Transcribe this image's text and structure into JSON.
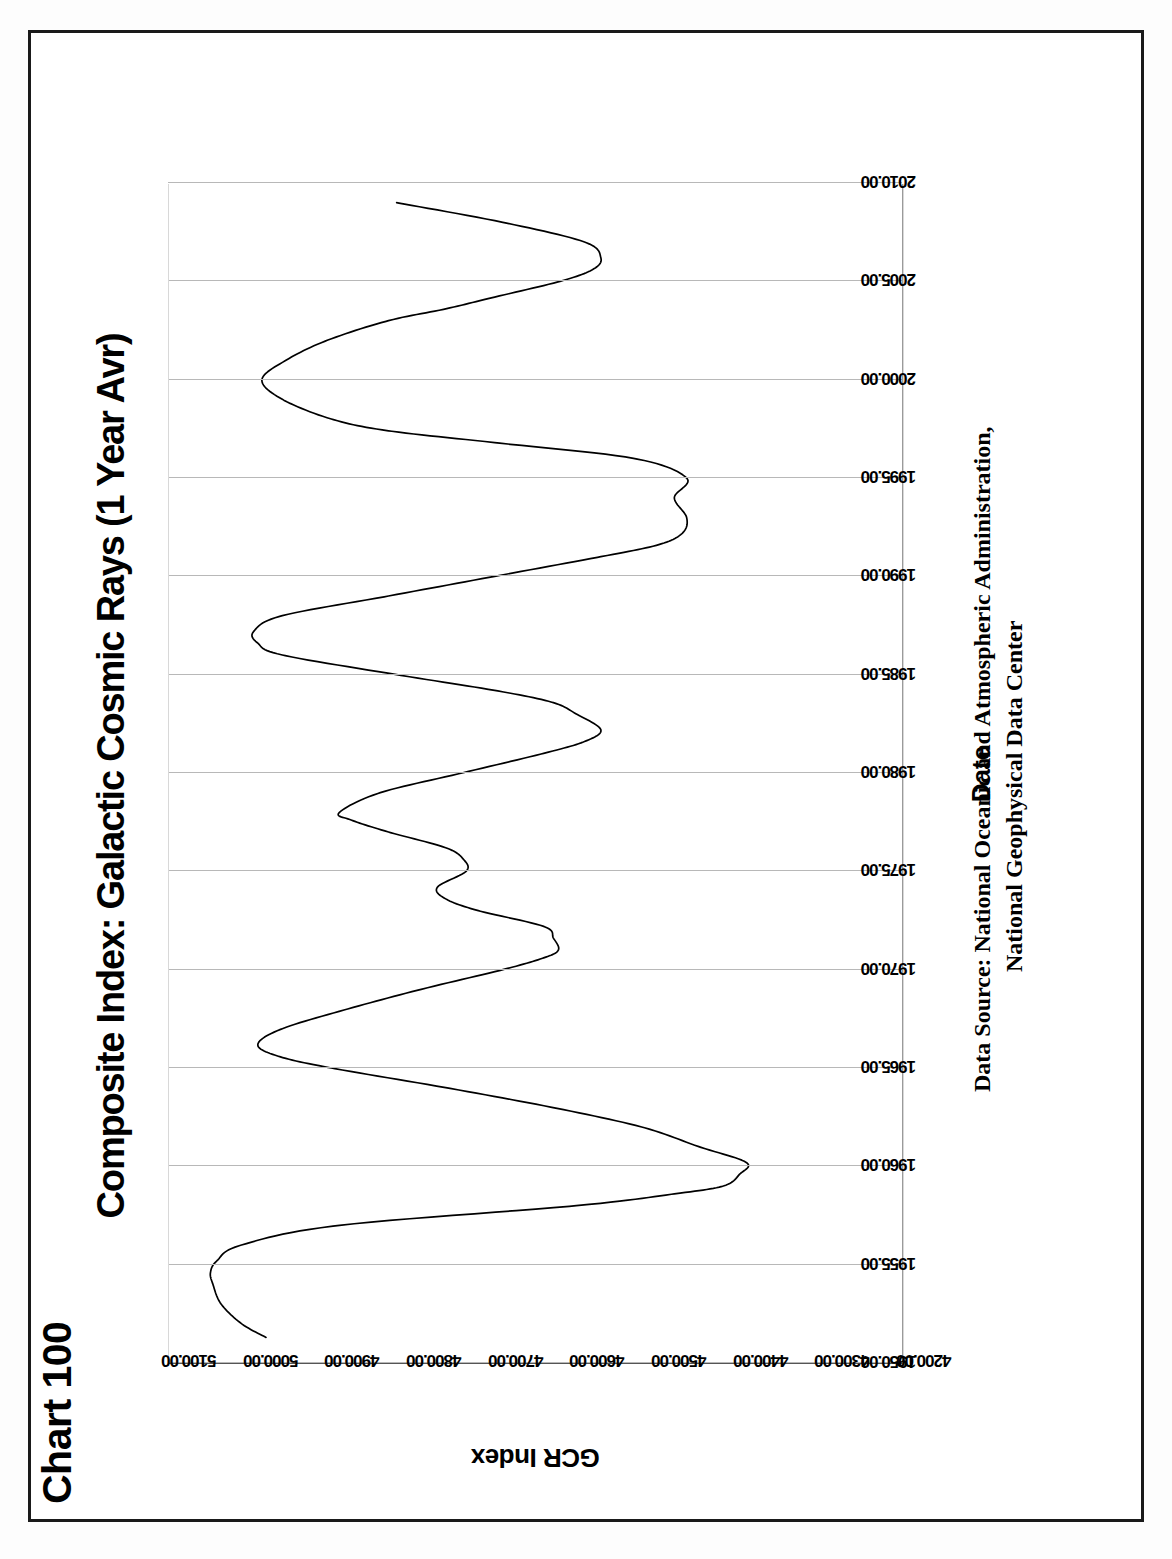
{
  "page": {
    "header": "Chart 100"
  },
  "chart_data": {
    "type": "line",
    "title": "Composite Index: Galactic Cosmic Rays (1 Year Avr)",
    "xlabel": "Date",
    "ylabel": "GCR Index",
    "source_line1": "Data Source:  National Oceanic and Atmospheric Administration,",
    "source_line2": "National Geophysical Data Center",
    "grid": true,
    "legend": "none",
    "xlim": [
      1950.0,
      2010.0
    ],
    "ylim": [
      4200.0,
      5100.0
    ],
    "xticks": [
      "1950.00",
      "1955.00",
      "1960.00",
      "1965.00",
      "1970.00",
      "1975.00",
      "1980.00",
      "1985.00",
      "1990.00",
      "1995.00",
      "2000.00",
      "2005.00",
      "2010.00"
    ],
    "yticks": [
      "4200.00",
      "4300.00",
      "4400.00",
      "4500.00",
      "4600.00",
      "4700.00",
      "4800.00",
      "4900.00",
      "5000.00",
      "5100.00"
    ],
    "series": [
      {
        "name": "GCR Index (1 Year Avr)",
        "color": "#000000",
        "x": [
          1951.3,
          1952.0,
          1953.0,
          1954.0,
          1954.6,
          1955.2,
          1956.0,
          1957.0,
          1958.0,
          1958.6,
          1959.0,
          1959.6,
          1960.2,
          1961.0,
          1962.0,
          1963.0,
          1964.0,
          1965.0,
          1965.6,
          1966.2,
          1967.0,
          1968.0,
          1969.0,
          1970.0,
          1970.6,
          1971.0,
          1971.6,
          1972.2,
          1973.0,
          1973.6,
          1974.2,
          1975.0,
          1975.6,
          1976.2,
          1977.0,
          1977.6,
          1978.0,
          1979.0,
          1980.0,
          1981.0,
          1981.6,
          1982.2,
          1983.0,
          1983.6,
          1984.2,
          1985.0,
          1986.0,
          1986.6,
          1987.2,
          1988.0,
          1989.0,
          1990.0,
          1991.0,
          1991.6,
          1992.2,
          1993.0,
          1994.0,
          1995.0,
          1996.0,
          1996.8,
          1997.4,
          1998.0,
          1999.0,
          2000.0,
          2001.0,
          2002.0,
          2003.0,
          2003.6,
          2004.2,
          2005.0,
          2005.6,
          2006.2,
          2007.0,
          2008.0,
          2009.0
        ],
        "y": [
          4980.0,
          5010.0,
          5035.0,
          5045.0,
          5048.0,
          5040.0,
          5010.0,
          4890.0,
          4600.0,
          4480.0,
          4420.0,
          4400.0,
          4392.0,
          4450.0,
          4520.0,
          4630.0,
          4760.0,
          4900.0,
          4965.0,
          4990.0,
          4960.0,
          4880.0,
          4790.0,
          4690.0,
          4640.0,
          4622.0,
          4628.0,
          4640.0,
          4720.0,
          4760.0,
          4770.0,
          4735.0,
          4738.0,
          4760.0,
          4830.0,
          4875.0,
          4890.0,
          4840.0,
          4740.0,
          4640.0,
          4590.0,
          4570.0,
          4600.0,
          4630.0,
          4700.0,
          4820.0,
          4960.0,
          4990.0,
          4995.0,
          4960.0,
          4830.0,
          4700.0,
          4570.0,
          4500.0,
          4470.0,
          4465.0,
          4480.0,
          4465.0,
          4530.0,
          4700.0,
          4830.0,
          4900.0,
          4960.0,
          4985.0,
          4955.0,
          4905.0,
          4830.0,
          4760.0,
          4700.0,
          4620.0,
          4580.0,
          4570.0,
          4590.0,
          4690.0,
          4820.0
        ],
        "approximate": true,
        "note": "values read off gridlines; curve is a 1-year running average of the composite galactic cosmic ray index"
      }
    ]
  }
}
